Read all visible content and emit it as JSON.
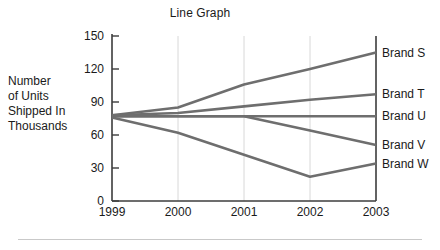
{
  "chart_data": {
    "type": "line",
    "title": "Line Graph",
    "xlabel": "",
    "ylabel": "Number of Units Shipped In Thousands",
    "ylabel_lines": [
      "Number",
      "of Units",
      "Shipped In",
      "Thousands"
    ],
    "categories": [
      "1999",
      "2000",
      "2001",
      "2002",
      "2003"
    ],
    "x": [
      1999,
      2000,
      2001,
      2002,
      2003
    ],
    "ylim": [
      0,
      150
    ],
    "yticks": [
      0,
      30,
      60,
      90,
      120,
      150
    ],
    "ytick_labels": [
      "0",
      "30",
      "60",
      "90",
      "120",
      "150"
    ],
    "grid": "vertical",
    "legend_position": "right-inline",
    "line_color": "#6e6e6e",
    "axis_color": "#3c3c3c",
    "gridline_color": "#d8d8d8",
    "series": [
      {
        "name": "Brand S",
        "values": [
          78,
          85,
          106,
          120,
          135
        ]
      },
      {
        "name": "Brand T",
        "values": [
          78,
          80,
          86,
          92,
          97
        ]
      },
      {
        "name": "Brand U",
        "values": [
          77,
          77,
          77,
          77,
          77
        ]
      },
      {
        "name": "Brand V",
        "values": [
          77,
          77,
          77,
          64,
          51
        ]
      },
      {
        "name": "Brand W",
        "values": [
          76,
          62,
          42,
          22,
          34
        ]
      }
    ]
  },
  "footer": {
    "rule": ""
  }
}
